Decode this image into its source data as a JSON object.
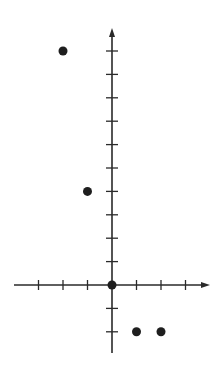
{
  "chart_data": {
    "type": "scatter",
    "title": "",
    "xlabel": "",
    "ylabel": "",
    "x": [
      -2,
      -1,
      0,
      1,
      2
    ],
    "y": [
      10,
      4,
      0,
      -2,
      -2
    ],
    "series": [
      {
        "name": "points",
        "points": [
          [
            -2,
            10
          ],
          [
            -1,
            4
          ],
          [
            0,
            0
          ],
          [
            1,
            -2
          ],
          [
            2,
            -2
          ]
        ]
      }
    ],
    "xlim": [
      -4,
      4
    ],
    "ylim": [
      -3,
      11
    ],
    "x_ticks": [
      -3,
      -2,
      -1,
      1,
      2,
      3
    ],
    "y_ticks": [
      -2,
      -1,
      1,
      2,
      3,
      4,
      5,
      6,
      7,
      8,
      9,
      10
    ],
    "tick_labels_shown": false,
    "grid": false,
    "legend": false,
    "axes_arrows": [
      "positive-x",
      "positive-y"
    ]
  },
  "style": {
    "axis_color": "#2a2a2a",
    "point_color": "#1e1e1e",
    "background": "#ffffff"
  },
  "layout": {
    "origin_px": [
      112,
      285
    ],
    "x_unit_px": 24.5,
    "y_unit_px": 23.4,
    "x_axis_px": [
      14,
      210
    ],
    "y_axis_px": [
      28,
      353
    ]
  }
}
